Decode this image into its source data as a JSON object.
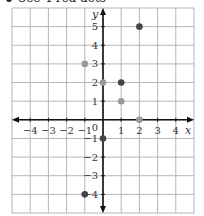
{
  "caption": "See 4 red dots",
  "chart_data": {
    "type": "scatter",
    "title": "",
    "xlabel": "x",
    "ylabel": "y",
    "xlim": [
      -5,
      5
    ],
    "ylim": [
      -5,
      6
    ],
    "grid": true,
    "x_ticks": [
      -4,
      -3,
      -2,
      -1,
      1,
      2,
      3,
      4
    ],
    "y_ticks": [
      -4,
      -3,
      -2,
      -1,
      1,
      2,
      3,
      4,
      5
    ],
    "origin_label": "0",
    "series": [
      {
        "name": "dark dots",
        "color": "#444444",
        "points": [
          [
            2,
            5
          ],
          [
            1,
            2
          ],
          [
            0,
            -1
          ],
          [
            -1,
            -4
          ]
        ]
      },
      {
        "name": "gray dots",
        "color": "#999999",
        "points": [
          [
            -1,
            3
          ],
          [
            0,
            2
          ],
          [
            1,
            1
          ],
          [
            2,
            0
          ]
        ]
      }
    ]
  },
  "colors": {
    "grid": "#b5b5b5",
    "axis": "#111111"
  }
}
